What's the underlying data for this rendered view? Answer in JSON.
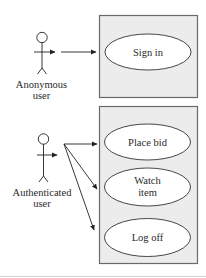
{
  "diagram": {
    "type": "uml-use-case",
    "colors": {
      "system_box_fill": "#ececec",
      "system_box_stroke": "#6a6a6a",
      "usecase_fill": "#ffffff",
      "line": "#222222",
      "bottom_rule": "#d4d4d4"
    },
    "actors": [
      {
        "id": "anonymous",
        "label_line1": "Anonymous",
        "label_line2": "user"
      },
      {
        "id": "authenticated",
        "label_line1": "Authenticated",
        "label_line2": "user"
      }
    ],
    "systems": [
      {
        "id": "public",
        "use_cases": [
          {
            "id": "sign-in",
            "label_line1": "Sign in",
            "label_line2": ""
          }
        ]
      },
      {
        "id": "member",
        "use_cases": [
          {
            "id": "place-bid",
            "label_line1": "Place bid",
            "label_line2": ""
          },
          {
            "id": "watch-item",
            "label_line1": "Watch",
            "label_line2": "item"
          },
          {
            "id": "log-off",
            "label_line1": "Log off",
            "label_line2": ""
          }
        ]
      }
    ],
    "associations": [
      {
        "from": "anonymous",
        "to": "sign-in"
      },
      {
        "from": "authenticated",
        "to": "place-bid"
      },
      {
        "from": "authenticated",
        "to": "watch-item"
      },
      {
        "from": "authenticated",
        "to": "log-off"
      }
    ]
  }
}
